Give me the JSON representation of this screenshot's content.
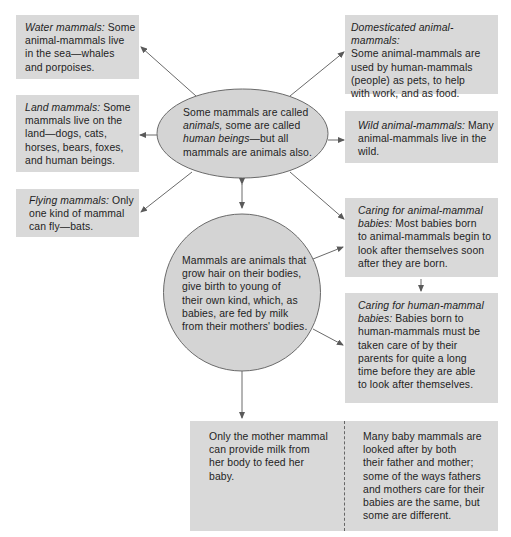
{
  "diagram": {
    "center_ellipse": {
      "line1": "Some mammals are called",
      "line2_italic": "animals,",
      "line2_rest": " some are called",
      "line3_italic": "human beings",
      "line3_rest": "—but all",
      "line4": "mammals are animals also."
    },
    "core_circle": {
      "lines": [
        "Mammals are animals that",
        "grow hair on their bodies,",
        "give birth to young of",
        "their own kind, which, as",
        "babies, are fed by milk",
        "from their mothers' bodies."
      ]
    },
    "left_boxes": [
      {
        "title": "Water mammals:",
        "lines": [
          " Some",
          "animal-mammals live",
          "in the sea—whales",
          "and porpoises."
        ]
      },
      {
        "title": "Land mammals:",
        "lines": [
          " Some",
          "mammals live on the",
          "land—dogs, cats,",
          "horses, bears, foxes,",
          "and human beings."
        ]
      },
      {
        "title": "Flying mammals:",
        "lines": [
          " Only",
          "one kind of mammal",
          "can fly—bats."
        ]
      }
    ],
    "right_boxes": [
      {
        "title": "Domesticated animal-mammals:",
        "lines": [
          "",
          "Some animal-mammals are",
          "used by human-mammals",
          "(people) as pets, to help",
          "with work, and as food."
        ]
      },
      {
        "title": "Wild animal-mammals:",
        "lines": [
          " Many",
          "animal-mammals live in the",
          "wild."
        ]
      },
      {
        "title_line1": "Caring for animal-mammal",
        "title_line2": "babies:",
        "lines": [
          " Most babies born",
          "to animal-mammals begin to",
          "look after themselves soon",
          "after they are born."
        ]
      },
      {
        "title_line1": "Caring for human-mammal",
        "title_line2": "babies:",
        "lines": [
          " Babies born to",
          "human-mammals must be",
          "taken care of by their",
          "parents for quite a long",
          "time before they are able",
          "to look after themselves."
        ]
      }
    ],
    "bottom_box": {
      "left_lines": [
        "Only the mother mammal",
        "can provide milk from",
        "her body to feed her",
        "baby."
      ],
      "right_lines": [
        "Many baby mammals are",
        "looked after by both",
        "their father and mother;",
        "some of the ways fathers",
        "and mothers care for their",
        "babies are the same, but",
        "some are different."
      ]
    },
    "colors": {
      "box_fill": "#d9d9d9",
      "node_fill": "#d4d4d4",
      "stroke": "#6a6a6a"
    }
  }
}
